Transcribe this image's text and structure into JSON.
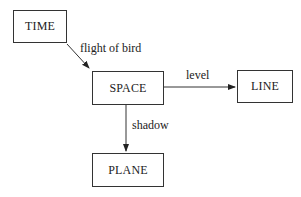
{
  "nodes": {
    "time": "TIME",
    "space": "SPACE",
    "line": "LINE",
    "plane": "PLANE"
  },
  "edges": {
    "time_to_space": "flight of bird",
    "space_to_line": "level",
    "space_to_plane": "shadow"
  }
}
